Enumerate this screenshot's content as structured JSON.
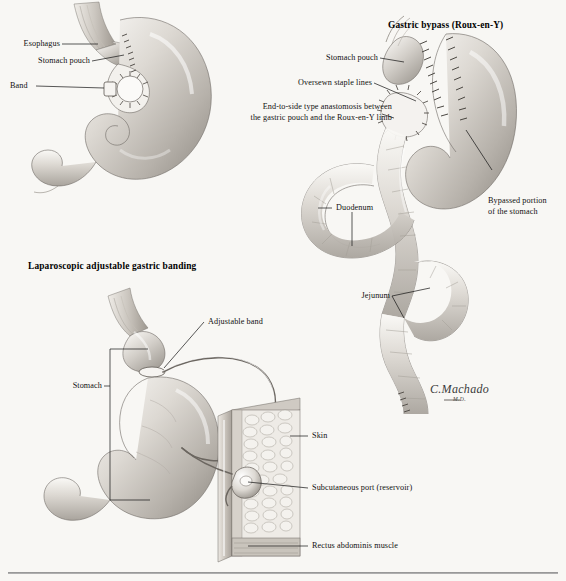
{
  "plate": {
    "background_color": "#f8f7f4",
    "ink_color": "#111111",
    "tissue_light": "#f2f0ec",
    "tissue_mid": "#cfcbc4",
    "tissue_dark": "#8d8881"
  },
  "panels": {
    "top_left": {
      "labels": [
        {
          "id": "esophagus",
          "text": "Esophagus"
        },
        {
          "id": "stomach_pouch",
          "text": "Stomach pouch"
        },
        {
          "id": "band",
          "text": "Band"
        }
      ]
    },
    "gastric_bypass": {
      "title": "Gastric bypass (Roux-en-Y)",
      "labels": [
        {
          "id": "stomach_pouch",
          "text": "Stomach pouch"
        },
        {
          "id": "oversewn_staple_lines",
          "text": "Oversewn staple lines"
        },
        {
          "id": "anastomosis_line1",
          "text": "End-to-side type anastomosis between"
        },
        {
          "id": "anastomosis_line2",
          "text": "the gastric pouch and the Roux-en-Y limb"
        },
        {
          "id": "bypassed_line1",
          "text": "Bypassed portion"
        },
        {
          "id": "bypassed_line2",
          "text": "of the stomach"
        },
        {
          "id": "duodenum",
          "text": "Duodenum"
        },
        {
          "id": "jejunum",
          "text": "Jejunum"
        }
      ]
    },
    "lap_band": {
      "title": "Laparoscopic adjustable gastric banding",
      "labels": [
        {
          "id": "adjustable_band",
          "text": "Adjustable band"
        },
        {
          "id": "stomach",
          "text": "Stomach"
        },
        {
          "id": "skin",
          "text": "Skin"
        },
        {
          "id": "subcutaneous_port",
          "text": "Subcutaneous port (reservoir)"
        },
        {
          "id": "rectus_abdominis",
          "text": "Rectus abdominis muscle"
        }
      ]
    }
  },
  "signature": {
    "name": "C.Machado",
    "credential": "M.D."
  }
}
